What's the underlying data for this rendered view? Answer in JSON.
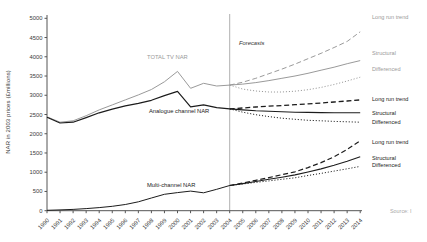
{
  "chart_data": {
    "type": "line",
    "title": "",
    "xlabel": "",
    "ylabel": "NAR in 2003 prices (£millions)",
    "ylim": [
      0,
      5000
    ],
    "y_ticks": [
      0,
      500,
      1000,
      1500,
      2000,
      2500,
      3000,
      3500,
      4000,
      4500,
      5000
    ],
    "x_ticks": [
      1990,
      1991,
      1992,
      1993,
      1994,
      1995,
      1996,
      1997,
      1998,
      1999,
      2000,
      2001,
      2002,
      2003,
      2004,
      2005,
      2006,
      2007,
      2008,
      2009,
      2010,
      2011,
      2012,
      2013,
      2014
    ],
    "x_actual": [
      1990,
      1991,
      1992,
      1993,
      1994,
      1995,
      1996,
      1997,
      1998,
      1999,
      2000,
      2001,
      2002,
      2003,
      2004
    ],
    "x_forecast": [
      2004,
      2005,
      2006,
      2007,
      2008,
      2009,
      2010,
      2011,
      2012,
      2013,
      2014
    ],
    "divider_year": 2004,
    "grid": "off",
    "colors": {
      "total_group": "#9a9a9a",
      "channel_group": "#1c1c1c",
      "axis": "#555555",
      "divider": "#b0b0b0"
    },
    "actual_series": [
      {
        "name": "TOTAL TV NAR",
        "color": "#9a9a9a",
        "style": "solid",
        "width": 1.0,
        "values": [
          2440,
          2300,
          2335,
          2470,
          2620,
          2750,
          2880,
          3010,
          3150,
          3350,
          3620,
          3180,
          3310,
          3240,
          3265
        ]
      },
      {
        "name": "Analogue channel NAR",
        "color": "#1c1c1c",
        "style": "solid",
        "width": 1.2,
        "values": [
          2430,
          2280,
          2300,
          2420,
          2545,
          2640,
          2725,
          2790,
          2870,
          2990,
          3100,
          2700,
          2750,
          2680,
          2645
        ]
      },
      {
        "name": "Multi-channel NAR",
        "color": "#1c1c1c",
        "style": "solid",
        "width": 1.0,
        "values": [
          10,
          20,
          35,
          55,
          80,
          115,
          160,
          230,
          330,
          425,
          470,
          510,
          465,
          555,
          655
        ]
      }
    ],
    "forecast_series": [
      {
        "group": "TOTAL TV NAR",
        "name": "Long run trend",
        "color": "#9a9a9a",
        "style": "dashed",
        "width": 1.0,
        "values": [
          3265,
          3340,
          3440,
          3560,
          3680,
          3810,
          3950,
          4090,
          4240,
          4400,
          4650
        ]
      },
      {
        "group": "TOTAL TV NAR",
        "name": "Structural",
        "color": "#9a9a9a",
        "style": "solid",
        "width": 1.0,
        "values": [
          3265,
          3290,
          3330,
          3380,
          3440,
          3500,
          3570,
          3650,
          3730,
          3820,
          3900
        ]
      },
      {
        "group": "TOTAL TV NAR",
        "name": "Differenced",
        "color": "#9a9a9a",
        "style": "dotted",
        "width": 1.0,
        "values": [
          3265,
          3160,
          3110,
          3085,
          3085,
          3105,
          3145,
          3205,
          3280,
          3370,
          3470
        ]
      },
      {
        "group": "Analogue channel NAR",
        "name": "Long run trend",
        "color": "#1c1c1c",
        "style": "dashed",
        "width": 1.3,
        "values": [
          2645,
          2670,
          2695,
          2715,
          2735,
          2755,
          2775,
          2800,
          2825,
          2850,
          2880
        ]
      },
      {
        "group": "Analogue channel NAR",
        "name": "Structural",
        "color": "#1c1c1c",
        "style": "solid",
        "width": 1.1,
        "values": [
          2645,
          2620,
          2600,
          2585,
          2570,
          2560,
          2555,
          2550,
          2545,
          2545,
          2545
        ]
      },
      {
        "group": "Analogue channel NAR",
        "name": "Differenced",
        "color": "#1c1c1c",
        "style": "dotted",
        "width": 1.0,
        "values": [
          2645,
          2560,
          2495,
          2445,
          2405,
          2375,
          2350,
          2335,
          2320,
          2310,
          2300
        ]
      },
      {
        "group": "Multi-channel NAR",
        "name": "Long run trend",
        "color": "#1c1c1c",
        "style": "dashed",
        "width": 1.2,
        "values": [
          655,
          720,
          790,
          860,
          935,
          1010,
          1120,
          1250,
          1400,
          1595,
          1820
        ]
      },
      {
        "group": "Multi-channel NAR",
        "name": "Structural",
        "color": "#1c1c1c",
        "style": "solid",
        "width": 1.1,
        "values": [
          655,
          705,
          760,
          815,
          870,
          930,
          1005,
          1085,
          1180,
          1285,
          1400
        ]
      },
      {
        "group": "Multi-channel NAR",
        "name": "Differenced",
        "color": "#1c1c1c",
        "style": "dotted",
        "width": 1.0,
        "values": [
          655,
          695,
          735,
          775,
          815,
          855,
          915,
          970,
          1030,
          1090,
          1150
        ]
      }
    ],
    "annotations": {
      "total_tv": "TOTAL TV NAR",
      "analogue": "Analogue channel NAR",
      "multichannel": "Multi-channel NAR",
      "forecasts": "Forecasts",
      "source": "Source: I"
    }
  }
}
